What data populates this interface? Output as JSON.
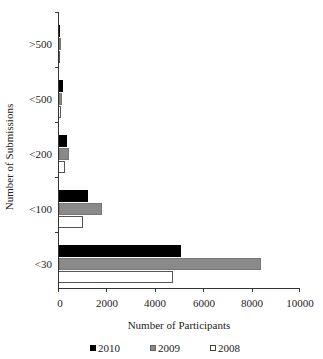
{
  "chart_data": {
    "type": "bar",
    "orientation": "horizontal",
    "title": "",
    "xlabel": "Number of Participants",
    "ylabel": "Number of Submissions",
    "categories": [
      ">500",
      "<500",
      "<200",
      "<100",
      "<30"
    ],
    "series": [
      {
        "name": "2010",
        "color": "#000000",
        "values": [
          40,
          150,
          330,
          1200,
          5080
        ]
      },
      {
        "name": "2009",
        "color": "#8a8a8a",
        "values": [
          25,
          120,
          410,
          1780,
          8390
        ]
      },
      {
        "name": "2008",
        "color": "#ffffff",
        "values": [
          15,
          100,
          250,
          990,
          4750
        ]
      }
    ],
    "xlim": [
      0,
      10000
    ],
    "xticks": [
      "0",
      "2000",
      "4000",
      "6000",
      "8000",
      "10000"
    ],
    "grid": false,
    "legend_position": "bottom"
  },
  "axes": {
    "xlabel": "Number of Participants",
    "ylabel": "Number of Submissions",
    "xticks": [
      "0",
      "2000",
      "4000",
      "6000",
      "8000",
      "10000"
    ],
    "categories": [
      ">500",
      "<500",
      "<200",
      "<100",
      "<30"
    ]
  },
  "legend": [
    "2010",
    "2009",
    "2008"
  ]
}
